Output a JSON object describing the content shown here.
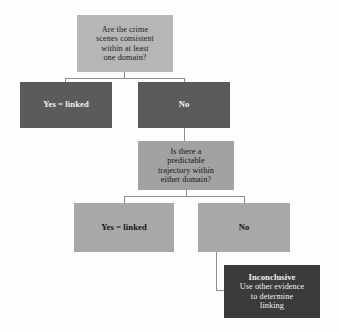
{
  "figure": {
    "background_color": "#fdfdfd"
  },
  "palette": {
    "question_light": "#b6b6b6",
    "question_mid": "#a2a2a2",
    "answer_dark": "#5b5b5b",
    "answer_gray": "#a8a8a8",
    "answer_black": "#3b3b3b",
    "connector": "#8e8e8e",
    "text_dark": "#1b1b1b",
    "text_light": "#f4f4f4"
  },
  "nodes": {
    "question_1": {
      "id": "q1",
      "type": "decision",
      "lines": [
        "Are the crime",
        "scenes consistent",
        "within at least",
        "one domain?"
      ]
    },
    "answer_1_yes": {
      "id": "a1-yes",
      "type": "terminal",
      "lines": [
        "Yes = linked"
      ]
    },
    "answer_1_no": {
      "id": "a1-no",
      "type": "branch",
      "lines": [
        "No"
      ]
    },
    "question_2": {
      "id": "q2",
      "type": "decision",
      "lines": [
        "Is there a",
        "predictable",
        "trajectory within",
        "either domain?"
      ]
    },
    "answer_2_yes": {
      "id": "a2-yes",
      "type": "terminal",
      "lines": [
        "Yes = linked"
      ]
    },
    "answer_2_no": {
      "id": "a2-no",
      "type": "branch",
      "lines": [
        "No"
      ]
    },
    "outcome": {
      "id": "outcome",
      "type": "terminal",
      "headline": "Inconclusive",
      "lines": [
        "Use other evidence",
        "to determine",
        "linking"
      ]
    }
  }
}
